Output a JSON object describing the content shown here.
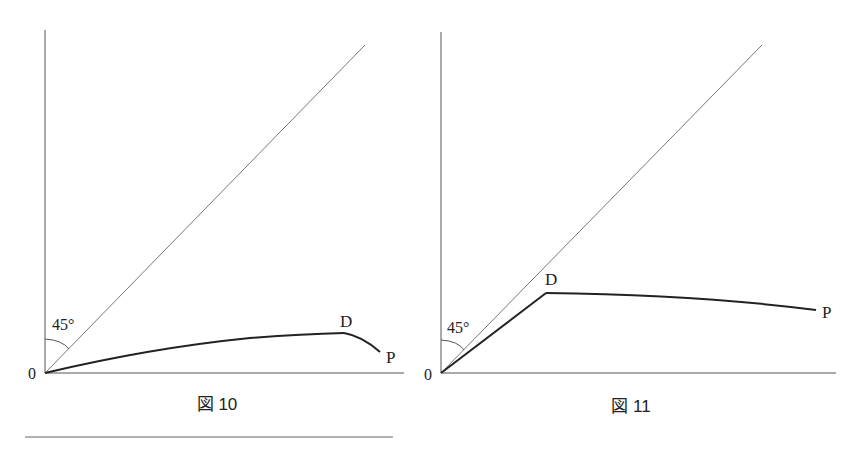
{
  "figures": [
    {
      "caption": "図 10",
      "origin_label": "0",
      "angle_label": "45°",
      "point_d_label": "D",
      "point_p_label": "P"
    },
    {
      "caption": "図 11",
      "origin_label": "0",
      "angle_label": "45°",
      "point_d_label": "D",
      "point_p_label": "P"
    }
  ],
  "colors": {
    "axis": "#555555",
    "diagonal": "#777777",
    "curve": "#222222",
    "text": "#222222"
  }
}
